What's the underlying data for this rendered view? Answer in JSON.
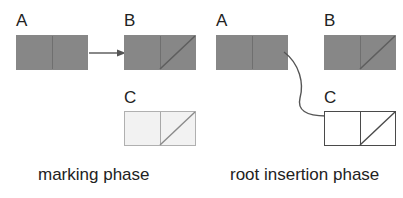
{
  "figure": {
    "type": "diagram",
    "background_color": "#ffffff",
    "colors": {
      "filled_gray": "#878787",
      "pale_fill": "#f2f2f2",
      "pale_border": "#b0b0b0",
      "white_fill": "#ffffff",
      "dark_border": "#4a4a4a",
      "text": "#222222",
      "arrow": "#555555"
    }
  },
  "panels": [
    {
      "id": "marking",
      "caption": "marking phase",
      "nodes": [
        {
          "id": "marking-a",
          "label": "A",
          "style": "gray",
          "divider": true,
          "diagonal": false,
          "diagonal_half": null
        },
        {
          "id": "marking-b",
          "label": "B",
          "style": "gray",
          "divider": true,
          "diagonal": true,
          "diagonal_half": "right"
        },
        {
          "id": "marking-c",
          "label": "C",
          "style": "pale",
          "divider": true,
          "diagonal": true,
          "diagonal_half": "right"
        }
      ],
      "arrows": [
        {
          "id": "marking-arrow",
          "kind": "straight",
          "from": "marking-a",
          "to": "marking-b",
          "direction": "right"
        }
      ]
    },
    {
      "id": "root-insertion",
      "caption": "root insertion phase",
      "nodes": [
        {
          "id": "root-a",
          "label": "A",
          "style": "gray",
          "divider": true,
          "diagonal": false,
          "diagonal_half": null
        },
        {
          "id": "root-b",
          "label": "B",
          "style": "gray",
          "divider": true,
          "diagonal": true,
          "diagonal_half": "right"
        },
        {
          "id": "root-c",
          "label": "C",
          "style": "white",
          "divider": true,
          "diagonal": true,
          "diagonal_half": "right"
        }
      ],
      "arrows": [
        {
          "id": "root-arrow",
          "kind": "curved",
          "from": "root-a",
          "to": "root-c",
          "direction": "right"
        }
      ]
    }
  ]
}
